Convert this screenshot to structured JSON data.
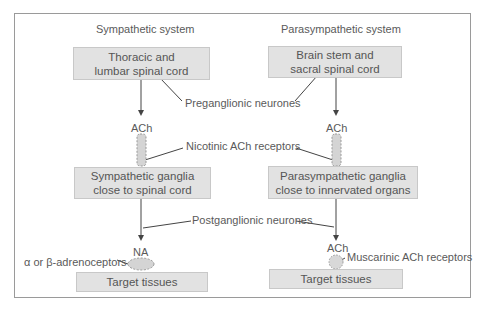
{
  "diagram": {
    "columns": [
      {
        "title": "Sympathetic system",
        "origin": [
          "Thoracic and",
          "lumbar spinal cord"
        ],
        "preganglionic_transmitter": "ACh",
        "ganglia": [
          "Sympathetic ganglia",
          "close to spinal cord"
        ],
        "postganglionic_transmitter": "NA",
        "receptor_label": "α or β-adrenoceptors",
        "target": "Target tissues"
      },
      {
        "title": "Parasympathetic system",
        "origin": [
          "Brain stem and",
          "sacral spinal cord"
        ],
        "preganglionic_transmitter": "ACh",
        "ganglia": [
          "Parasympathetic ganglia",
          "close to innervated organs"
        ],
        "postganglionic_transmitter": "ACh",
        "receptor_label": "Muscarinic ACh receptors",
        "target": "Target tissues"
      }
    ],
    "shared_labels": {
      "preganglionic": "Preganglionic neurones",
      "nicotinic": "Nicotinic ACh receptors",
      "postganglionic": "Postganglionic neurones"
    },
    "colors": {
      "box_fill": "#e2e2e2",
      "box_border": "#c8c8c8",
      "line": "#444444",
      "text": "#555555",
      "frame": "#9a9a9a"
    }
  }
}
